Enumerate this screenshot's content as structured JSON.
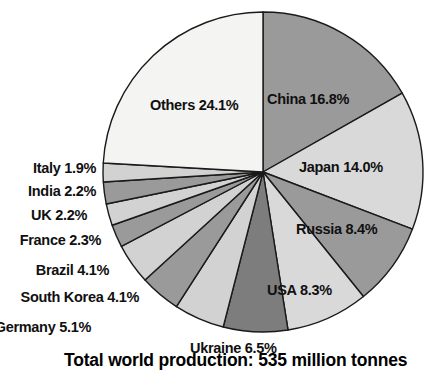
{
  "chart_data": {
    "type": "pie",
    "title": "",
    "caption": "Total world production: 535 million tonnes",
    "total_label": "535 million tonnes",
    "start_angle_deg": 0,
    "direction": "clockwise",
    "center": {
      "x": 263,
      "y": 172
    },
    "radius": 160,
    "stroke_color": "#1a1a1a",
    "categories": [
      "China",
      "Japan",
      "Russia",
      "USA",
      "Ukraine",
      "Germany",
      "South Korea",
      "Brazil",
      "France",
      "UK",
      "India",
      "Italy",
      "Others"
    ],
    "values": [
      16.8,
      14.0,
      8.4,
      8.3,
      6.5,
      5.1,
      4.1,
      4.1,
      2.3,
      2.2,
      2.2,
      1.9,
      24.1
    ],
    "colors": [
      "#9a9a9a",
      "#d9d9d9",
      "#9a9a9a",
      "#d9d9d9",
      "#7d7d7d",
      "#d2d2d2",
      "#9a9a9a",
      "#d2d2d2",
      "#9a9a9a",
      "#d2d2d2",
      "#9a9a9a",
      "#d2d2d2",
      "#f4f4f2"
    ],
    "slices": [
      {
        "name": "China",
        "value": 16.8,
        "label": "China 16.8%",
        "color": "#9a9a9a",
        "placement": "inside"
      },
      {
        "name": "Japan",
        "value": 14.0,
        "label": "Japan 14.0%",
        "color": "#d9d9d9",
        "placement": "inside"
      },
      {
        "name": "Russia",
        "value": 8.4,
        "label": "Russia 8.4%",
        "color": "#9a9a9a",
        "placement": "inside"
      },
      {
        "name": "USA",
        "value": 8.3,
        "label": "USA 8.3%",
        "color": "#d9d9d9",
        "placement": "inside"
      },
      {
        "name": "Ukraine",
        "value": 6.5,
        "label": "Ukraine 6.5%",
        "color": "#7d7d7d",
        "placement": "outside-bottom"
      },
      {
        "name": "Germany",
        "value": 5.1,
        "label": "Germany 5.1%",
        "color": "#d2d2d2",
        "placement": "outside-left"
      },
      {
        "name": "South Korea",
        "value": 4.1,
        "label": "South Korea 4.1%",
        "color": "#9a9a9a",
        "placement": "outside-left"
      },
      {
        "name": "Brazil",
        "value": 4.1,
        "label": "Brazil 4.1%",
        "color": "#d2d2d2",
        "placement": "outside-left"
      },
      {
        "name": "France",
        "value": 2.3,
        "label": "France 2.3%",
        "color": "#9a9a9a",
        "placement": "outside-left"
      },
      {
        "name": "UK",
        "value": 2.2,
        "label": "UK 2.2%",
        "color": "#d2d2d2",
        "placement": "outside-left"
      },
      {
        "name": "India",
        "value": 2.2,
        "label": "India 2.2%",
        "color": "#9a9a9a",
        "placement": "outside-left"
      },
      {
        "name": "Italy",
        "value": 1.9,
        "label": "Italy 1.9%",
        "color": "#d2d2d2",
        "placement": "outside-left"
      },
      {
        "name": "Others",
        "value": 24.1,
        "label": "Others 24.1%",
        "color": "#f4f4f2",
        "placement": "inside"
      }
    ],
    "labels": {
      "china": "China 16.8%",
      "japan": "Japan 14.0%",
      "russia": "Russia 8.4%",
      "usa": "USA 8.3%",
      "ukraine": "Ukraine 6.5%",
      "germany": "Germany 5.1%",
      "south_korea": "South Korea 4.1%",
      "brazil": "Brazil 4.1%",
      "france": "France 2.3%",
      "uk": "UK 2.2%",
      "india": "India 2.2%",
      "italy": "Italy 1.9%",
      "others": "Others 24.1%"
    },
    "label_positions": {
      "china": {
        "left": 267,
        "top": 92,
        "align": "left"
      },
      "japan": {
        "left": 299,
        "top": 160,
        "align": "left"
      },
      "russia": {
        "left": 296,
        "top": 222,
        "align": "left"
      },
      "usa": {
        "left": 267,
        "top": 283,
        "align": "left"
      },
      "ukraine": {
        "left": 190,
        "top": 341,
        "align": "left"
      },
      "germany": {
        "right": 348,
        "top": 320,
        "align": "right"
      },
      "south_korea": {
        "right": 300,
        "top": 290,
        "align": "right"
      },
      "brazil": {
        "right": 330,
        "top": 263,
        "align": "right"
      },
      "france": {
        "right": 338,
        "top": 233,
        "align": "right"
      },
      "uk": {
        "right": 352,
        "top": 208,
        "align": "right"
      },
      "india": {
        "right": 343,
        "top": 184,
        "align": "right"
      },
      "italy": {
        "right": 343,
        "top": 161,
        "align": "right"
      },
      "others": {
        "left": 150,
        "top": 98,
        "align": "left"
      }
    },
    "legend": "none",
    "grid": false,
    "axis": "none"
  }
}
